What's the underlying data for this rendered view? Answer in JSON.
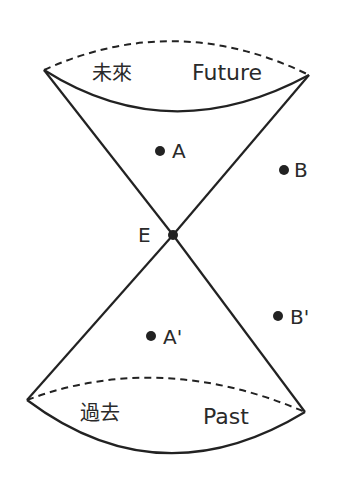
{
  "diagram": {
    "type": "light-cone",
    "labels": {
      "future_zh": "未來",
      "future_en": "Future",
      "past_zh": "過去",
      "past_en": "Past",
      "event": "E",
      "point_a": "A",
      "point_b": "B",
      "point_a_prime": "A'",
      "point_b_prime": "B'"
    },
    "colors": {
      "line": "#222222",
      "text": "#2a2a2a",
      "background": "#ffffff"
    }
  }
}
